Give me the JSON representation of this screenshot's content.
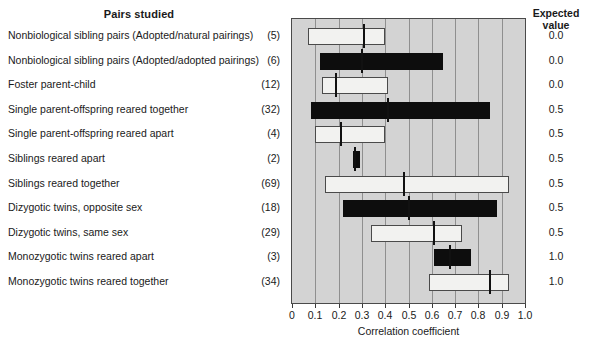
{
  "headers": {
    "left_title": "Pairs studied",
    "right_title_line1": "Expected",
    "right_title_line2": "value"
  },
  "chart_data": {
    "type": "bar",
    "title": "Pairs studied",
    "xlabel": "Correlation coefficient",
    "ylabel": "",
    "xlim": [
      0,
      1.0
    ],
    "grid": true,
    "legend": false,
    "xticks": [
      "0",
      "0.1",
      "0.2",
      "0.3",
      "0.4",
      "0.5",
      "0.6",
      "0.7",
      "0.8",
      "0.9",
      "1.0"
    ],
    "xtick_values": [
      0,
      0.1,
      0.2,
      0.3,
      0.4,
      0.5,
      0.6,
      0.7,
      0.8,
      0.9,
      1.0
    ],
    "rows": [
      {
        "label": "Nonbiological sibling pairs (Adopted/natural pairings)",
        "count": "(5)",
        "expected_value": "0.0",
        "fill": "white",
        "range_min": 0.07,
        "range_max": 0.4,
        "median": 0.31
      },
      {
        "label": "Nonbiological sibling pairs (Adopted/adopted pairings)",
        "count": "(6)",
        "expected_value": "0.0",
        "fill": "black",
        "range_min": 0.12,
        "range_max": 0.65,
        "median": 0.3
      },
      {
        "label": "Foster parent-child",
        "count": "(12)",
        "expected_value": "0.0",
        "fill": "white",
        "range_min": 0.13,
        "range_max": 0.41,
        "median": 0.19
      },
      {
        "label": "Single parent-offspring reared together",
        "count": "(32)",
        "expected_value": "0.5",
        "fill": "black",
        "range_min": 0.08,
        "range_max": 0.85,
        "median": 0.41
      },
      {
        "label": "Single parent-offspring reared apart",
        "count": "(4)",
        "expected_value": "0.5",
        "fill": "white",
        "range_min": 0.1,
        "range_max": 0.4,
        "median": 0.21
      },
      {
        "label": "Siblings reared apart",
        "count": "(2)",
        "expected_value": "0.5",
        "fill": "black",
        "range_min": 0.26,
        "range_max": 0.29,
        "median": 0.27
      },
      {
        "label": "Siblings reared together",
        "count": "(69)",
        "expected_value": "0.5",
        "fill": "white",
        "range_min": 0.14,
        "range_max": 0.93,
        "median": 0.48
      },
      {
        "label": "Dizygotic twins, opposite sex",
        "count": "(18)",
        "expected_value": "0.5",
        "fill": "black",
        "range_min": 0.22,
        "range_max": 0.88,
        "median": 0.5
      },
      {
        "label": "Dizygotic twins, same sex",
        "count": "(29)",
        "expected_value": "0.5",
        "fill": "white",
        "range_min": 0.34,
        "range_max": 0.73,
        "median": 0.61
      },
      {
        "label": "Monozygotic twins reared apart",
        "count": "(3)",
        "expected_value": "1.0",
        "fill": "black",
        "range_min": 0.61,
        "range_max": 0.77,
        "median": 0.68
      },
      {
        "label": "Monozygotic twins reared together",
        "count": "(34)",
        "expected_value": "1.0",
        "fill": "white",
        "range_min": 0.59,
        "range_max": 0.93,
        "median": 0.85
      }
    ]
  },
  "colors": {
    "plot_background": "#d3d3d3",
    "gridline": "#8f8f8f",
    "bar_white": "#f2f2f0",
    "bar_black": "#0d0d0d",
    "axis": "#4a4a4a"
  }
}
